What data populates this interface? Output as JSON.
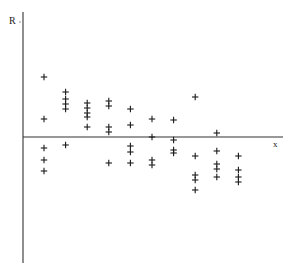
{
  "chart_data": {
    "type": "scatter",
    "title": "",
    "xlabel": "x",
    "ylabel": "R",
    "marker": "+",
    "grid": false,
    "legend": null,
    "axis_color": "#333333",
    "marker_color": "#1a1a1a",
    "xlim": [
      0,
      11.5
    ],
    "ylim": [
      -12.5,
      12.5
    ],
    "points": [
      {
        "x": 1,
        "y": 6.0
      },
      {
        "x": 1,
        "y": 1.8
      },
      {
        "x": 1,
        "y": -1.1
      },
      {
        "x": 1,
        "y": -2.3
      },
      {
        "x": 1,
        "y": -3.4
      },
      {
        "x": 2,
        "y": 4.5
      },
      {
        "x": 2,
        "y": 3.8
      },
      {
        "x": 2,
        "y": 3.3
      },
      {
        "x": 2,
        "y": 2.8
      },
      {
        "x": 2,
        "y": -0.8
      },
      {
        "x": 3,
        "y": 3.4
      },
      {
        "x": 3,
        "y": 2.9
      },
      {
        "x": 3,
        "y": 2.4
      },
      {
        "x": 3,
        "y": 2.0
      },
      {
        "x": 3,
        "y": 1.0
      },
      {
        "x": 4,
        "y": 3.6
      },
      {
        "x": 4,
        "y": 3.1
      },
      {
        "x": 4,
        "y": 1.0
      },
      {
        "x": 4,
        "y": 0.5
      },
      {
        "x": 4,
        "y": -2.6
      },
      {
        "x": 5,
        "y": 2.8
      },
      {
        "x": 5,
        "y": 1.2
      },
      {
        "x": 5,
        "y": -0.9
      },
      {
        "x": 5,
        "y": -1.5
      },
      {
        "x": 5,
        "y": -2.6
      },
      {
        "x": 6,
        "y": 1.8
      },
      {
        "x": 6,
        "y": 0.0
      },
      {
        "x": 6,
        "y": -2.3
      },
      {
        "x": 6,
        "y": -2.8
      },
      {
        "x": 7,
        "y": 1.7
      },
      {
        "x": 7,
        "y": -0.3
      },
      {
        "x": 7,
        "y": -1.3
      },
      {
        "x": 7,
        "y": -1.6
      },
      {
        "x": 8,
        "y": 4.0
      },
      {
        "x": 8,
        "y": -1.9
      },
      {
        "x": 8,
        "y": -3.8
      },
      {
        "x": 8,
        "y": -4.3
      },
      {
        "x": 8,
        "y": -5.3
      },
      {
        "x": 9,
        "y": 0.4
      },
      {
        "x": 9,
        "y": -1.4
      },
      {
        "x": 9,
        "y": -2.7
      },
      {
        "x": 9,
        "y": -3.2
      },
      {
        "x": 9,
        "y": -4.0
      },
      {
        "x": 10,
        "y": -1.9
      },
      {
        "x": 10,
        "y": -3.3
      },
      {
        "x": 10,
        "y": -4.0
      },
      {
        "x": 10,
        "y": -4.5
      }
    ]
  }
}
